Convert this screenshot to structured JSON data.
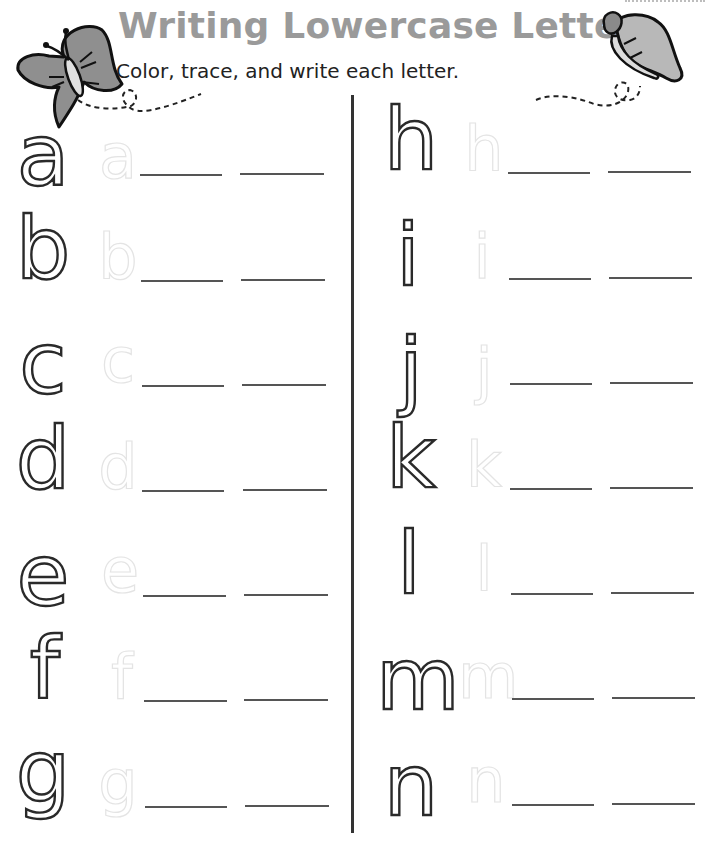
{
  "header": {
    "title": "Writing Lowercase Letters",
    "subtitle": "Color, trace, and write each letter."
  },
  "decorations": {
    "left_icon": "butterfly-icon",
    "right_icon": "butterfly-icon",
    "title_color": "#9a9a9a"
  },
  "columns": [
    {
      "rows": [
        {
          "letter": "a",
          "trace": "a"
        },
        {
          "letter": "b",
          "trace": "b"
        },
        {
          "letter": "c",
          "trace": "c"
        },
        {
          "letter": "d",
          "trace": "d"
        },
        {
          "letter": "e",
          "trace": "e"
        },
        {
          "letter": "f",
          "trace": "f"
        },
        {
          "letter": "g",
          "trace": "g"
        }
      ]
    },
    {
      "rows": [
        {
          "letter": "h",
          "trace": "h"
        },
        {
          "letter": "i",
          "trace": "i"
        },
        {
          "letter": "j",
          "trace": "j"
        },
        {
          "letter": "k",
          "trace": "k"
        },
        {
          "letter": "l",
          "trace": "l"
        },
        {
          "letter": "m",
          "trace": "m"
        },
        {
          "letter": "n",
          "trace": "n"
        }
      ]
    }
  ]
}
